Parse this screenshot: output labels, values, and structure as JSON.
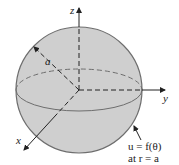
{
  "diagram": {
    "axes": {
      "z_label": "z",
      "y_label": "y",
      "x_label": "x"
    },
    "radius_label": "a",
    "annotation": {
      "line1": "u = f(θ)",
      "line2": "at r = a"
    },
    "colors": {
      "sphere_fill": "#cfcfcf",
      "sphere_stroke": "#6e6e6e",
      "axis": "#222222"
    }
  }
}
